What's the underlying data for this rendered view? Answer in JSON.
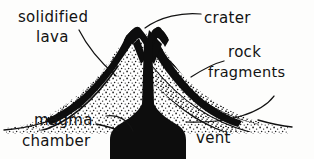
{
  "diagram": {
    "background_color": "#fdfdfc",
    "ink_color": "#0d0d0d",
    "labels": {
      "solidified_lava_line1": "solidified",
      "solidified_lava_line2": "lava",
      "crater": "crater",
      "rock_line1": "rock",
      "rock_line2": "fragments",
      "magma_line1": "magma",
      "magma_line2": "chamber",
      "vent": "vent"
    },
    "parts": {
      "crust": "solidified-lava-crust",
      "crater_notch": "summit-crater-notch",
      "conduit": "volcanic-conduit",
      "chamber": "magma-chamber",
      "tephra": "rock-fragment-layers",
      "ground": "ground-line"
    }
  }
}
